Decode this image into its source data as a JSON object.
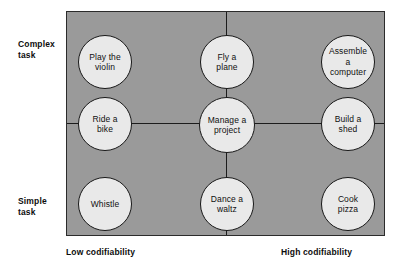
{
  "diagram": {
    "colors": {
      "panel_background": "#9a9a9a",
      "node_fill": "#e9e9e9",
      "node_stroke": "#181818",
      "line": "#1c1c1c",
      "text": "#0d0d0d",
      "page_background": "#ffffff"
    },
    "axes": {
      "y_top_label": "Complex\ntask",
      "y_bottom_label": "Simple\ntask",
      "x_left_label": "Low codifiability",
      "x_right_label": "High codifiability"
    },
    "nodes": [
      {
        "id": "play-the-violin",
        "label": "Play the\nviolin",
        "row": "complex",
        "column": "low"
      },
      {
        "id": "fly-a-plane",
        "label": "Fly a\nplane",
        "row": "complex",
        "column": "medium"
      },
      {
        "id": "assemble-a-computer",
        "label": "Assemble\na\ncomputer",
        "row": "complex",
        "column": "high"
      },
      {
        "id": "ride-a-bike",
        "label": "Ride a\nbike",
        "row": "middle",
        "column": "low"
      },
      {
        "id": "manage-a-project",
        "label": "Manage a\nproject",
        "row": "middle",
        "column": "medium"
      },
      {
        "id": "build-a-shed",
        "label": "Build a\nshed",
        "row": "middle",
        "column": "high"
      },
      {
        "id": "whistle",
        "label": "Whistle",
        "row": "simple",
        "column": "low"
      },
      {
        "id": "dance-a-waltz",
        "label": "Dance a\nwaltz",
        "row": "simple",
        "column": "medium"
      },
      {
        "id": "cook-pizza",
        "label": "Cook\npizza",
        "row": "simple",
        "column": "high"
      }
    ]
  }
}
